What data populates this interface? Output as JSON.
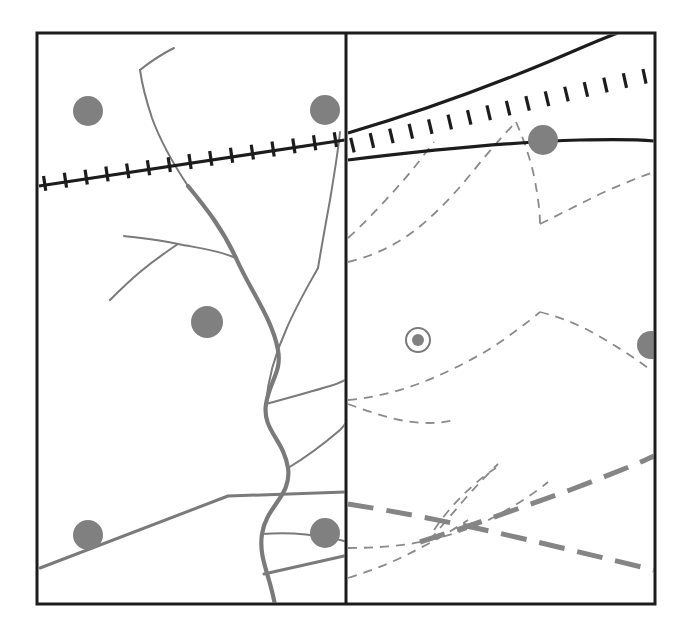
{
  "figure": {
    "type": "two-panel-geologic-map",
    "canvas": {
      "width": 689,
      "height": 632,
      "background": "#ffffff"
    },
    "frame": {
      "name": "map-frame",
      "x": 37,
      "y": 33,
      "width": 618,
      "height": 571,
      "stroke": "#1c1c1c",
      "stroke_width": 3
    },
    "divider": {
      "name": "panel-divider",
      "x": 346,
      "y1": 33,
      "y2": 604,
      "stroke": "#1c1c1c",
      "stroke_width": 3
    }
  },
  "style": {
    "black": "#1c1c1c",
    "gray_line": "#7a7a7a",
    "gray_fill": "#808080",
    "gray_dash": "#8a8a8a",
    "thick_dash": "#858585",
    "frame_stroke_width": 3,
    "fault_stroke_width": 3.2,
    "tick_stroke_width": 3.2,
    "stream_stroke_width": 2,
    "trunk_stroke_width": 4.2,
    "dash_stroke_width": 1.8,
    "thick_dash_stroke_width": 5
  },
  "left_panel": {
    "name": "surface-drainage-panel",
    "fault": {
      "name": "thrust-fault-left",
      "label": "thrust fault with hanging-wall ticks",
      "path": "M 39 186 L 345 140",
      "ticks": {
        "count": 15,
        "length": 15,
        "spacing": 21,
        "start_offset": 6
      }
    },
    "trunk_channel": {
      "name": "trunk-channel",
      "path": "M 276 612 C 272 578 258 560 262 534 C 266 506 292 496 288 468 C 284 440 262 430 266 404 C 270 380 282 372 278 350 C 272 318 250 290 236 258 C 222 228 206 208 188 186"
    },
    "tributaries": [
      {
        "name": "tributary-upper-left",
        "path": "M 188 186 C 176 168 160 140 152 118 C 146 100 142 84 140 70"
      },
      {
        "name": "tributary-mid-left",
        "path": "M 236 258 C 218 250 198 248 178 244 C 160 240 140 238 124 236"
      },
      {
        "name": "tributary-left-branch",
        "path": "M 178 244 C 166 252 152 262 140 272 C 128 282 118 292 110 300"
      },
      {
        "name": "tributary-upper-center",
        "path": "M 266 404 C 268 378 276 352 286 330 C 296 306 308 286 318 268"
      },
      {
        "name": "tributary-north-spur",
        "path": "M 318 268 C 322 244 326 222 330 200 C 334 176 338 152 340 132"
      },
      {
        "name": "tributary-east-1",
        "path": "M 266 404 C 288 398 310 392 330 386 C 342 382 346 380 348 378"
      },
      {
        "name": "tributary-east-2",
        "path": "M 288 468 C 308 456 326 442 340 430 C 346 424 348 420 350 416"
      },
      {
        "name": "tributary-east-3",
        "path": "M 262 534 C 286 532 310 534 330 538 C 342 540 348 542 352 544"
      },
      {
        "name": "tributary-far-north",
        "path": "M 140 70 C 150 62 162 54 174 48"
      }
    ],
    "straight_lineaments": [
      {
        "name": "lineament-sw-ne",
        "path": "M 40 568 L 228 496 L 348 492"
      },
      {
        "name": "lineament-lower-east",
        "path": "M 264 574 L 344 556"
      }
    ],
    "site_circles": [
      {
        "name": "sample-site",
        "cx": 88,
        "cy": 111,
        "r": 15
      },
      {
        "name": "sample-site",
        "cx": 325,
        "cy": 110,
        "r": 15
      },
      {
        "name": "sample-site",
        "cx": 207,
        "cy": 322,
        "r": 16
      },
      {
        "name": "sample-site",
        "cx": 88,
        "cy": 535,
        "r": 15
      },
      {
        "name": "sample-site",
        "cx": 325,
        "cy": 533,
        "r": 15
      }
    ]
  },
  "right_panel": {
    "name": "subsurface-paleochannel-panel",
    "fault_zone": {
      "name": "fault-zone-right",
      "label": "fault zone bounded by two traces with ticks",
      "upper_trace": "M 348 133 C 420 112 490 86 548 62 C 586 46 608 36 618 33",
      "lower_trace": "M 348 160 C 430 150 510 142 580 140 C 620 139 644 140 654 141",
      "tick_line": "M 348 148 C 424 130 500 112 566 96 C 608 86 640 79 655 76",
      "ticks": {
        "count": 16,
        "length": 15,
        "spacing": 20,
        "start_offset": 5
      }
    },
    "paleochannels": [
      {
        "name": "paleochannel-dashed",
        "path": "M 348 238 C 368 220 386 200 402 182 C 416 166 426 152 434 142"
      },
      {
        "name": "paleochannel-dashed",
        "path": "M 348 262 C 374 256 398 244 418 228 C 440 210 458 190 474 170 C 492 148 506 132 516 122"
      },
      {
        "name": "paleochannel-dashed",
        "path": "M 516 122 C 524 140 530 158 534 176 C 538 196 540 212 540 224"
      },
      {
        "name": "paleochannel-dashed",
        "path": "M 540 224 C 560 214 580 204 600 194 C 622 184 642 176 654 172"
      },
      {
        "name": "paleochannel-dashed",
        "path": "M 348 400 C 372 398 396 392 418 384 C 444 374 468 362 488 350 C 510 336 528 322 540 312"
      },
      {
        "name": "paleochannel-dashed",
        "path": "M 540 312 C 556 316 572 322 588 330 C 610 342 632 356 648 368"
      },
      {
        "name": "paleochannel-dashed",
        "path": "M 348 404 C 364 410 382 416 400 420 C 420 424 438 424 454 420"
      },
      {
        "name": "paleochannel-dashed",
        "path": "M 348 548 C 376 548 404 546 430 540 C 456 534 478 526 496 516 C 518 504 536 492 548 482"
      },
      {
        "name": "paleochannel-dashed",
        "path": "M 430 540 C 440 528 452 514 464 500 C 476 486 488 474 498 464"
      },
      {
        "name": "paleochannel-dashed",
        "path": "M 434 530 C 442 518 452 506 462 496 C 474 484 486 474 496 468"
      },
      {
        "name": "paleochannel-dashed",
        "path": "M 348 578 C 374 570 398 560 420 548 C 440 538 456 528 468 520"
      }
    ],
    "thick_lineaments": [
      {
        "name": "lineament-descending",
        "path": "M 348 504 C 400 512 460 524 520 538 C 580 552 628 564 654 570"
      },
      {
        "name": "lineament-ascending",
        "path": "M 420 542 C 470 526 520 508 570 490 C 612 474 642 462 654 456"
      }
    ],
    "well_marker": {
      "name": "well-marker",
      "label": "cased well / borehole location",
      "cx": 418,
      "cy": 340,
      "outer_r": 12,
      "inner_r": 6,
      "ring_stroke_width": 2
    },
    "site_circles": [
      {
        "name": "sample-site",
        "cx": 543,
        "cy": 140,
        "r": 15
      },
      {
        "name": "sample-site",
        "cx": 651,
        "cy": 345,
        "r": 14
      }
    ]
  }
}
